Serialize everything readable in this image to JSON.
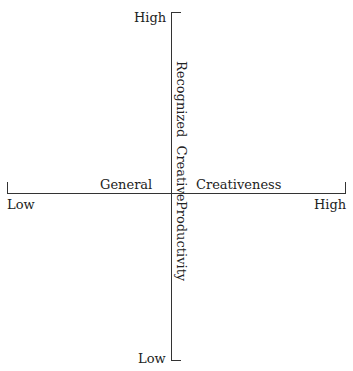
{
  "diagram": {
    "type": "quadrant-axes",
    "vertical_axis": {
      "top_label": "High",
      "bottom_label": "Low",
      "title_upper": "Recognized Creative",
      "title_lower": "Productivity"
    },
    "horizontal_axis": {
      "left_label": "Low",
      "right_label": "High",
      "title_left": "General",
      "title_right": "Creativeness"
    },
    "colors": {
      "line": "#333333",
      "text": "#222222",
      "background": "#ffffff"
    }
  }
}
